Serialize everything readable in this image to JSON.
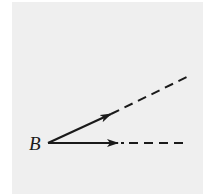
{
  "diagram": {
    "type": "geometry-rays",
    "background_color": "#efefef",
    "stroke_color": "#1a1a1a",
    "vertex": {
      "label": "B",
      "x": 48,
      "y": 143
    },
    "rays": [
      {
        "name": "upper-ray",
        "direction": "up-right",
        "solid_segment": {
          "x1": 48,
          "y1": 143,
          "x2": 111,
          "y2": 114
        },
        "arrowhead_at": {
          "x": 111,
          "y": 114
        },
        "dashed_segment": {
          "x1": 111,
          "y1": 114,
          "x2": 191,
          "y2": 75
        }
      },
      {
        "name": "horizontal-ray",
        "direction": "right",
        "solid_segment": {
          "x1": 48,
          "y1": 143,
          "x2": 118,
          "y2": 143
        },
        "arrowhead_at": {
          "x": 118,
          "y": 143
        },
        "dashed_segment": {
          "x1": 118,
          "y1": 143,
          "x2": 189,
          "y2": 143
        }
      }
    ]
  }
}
